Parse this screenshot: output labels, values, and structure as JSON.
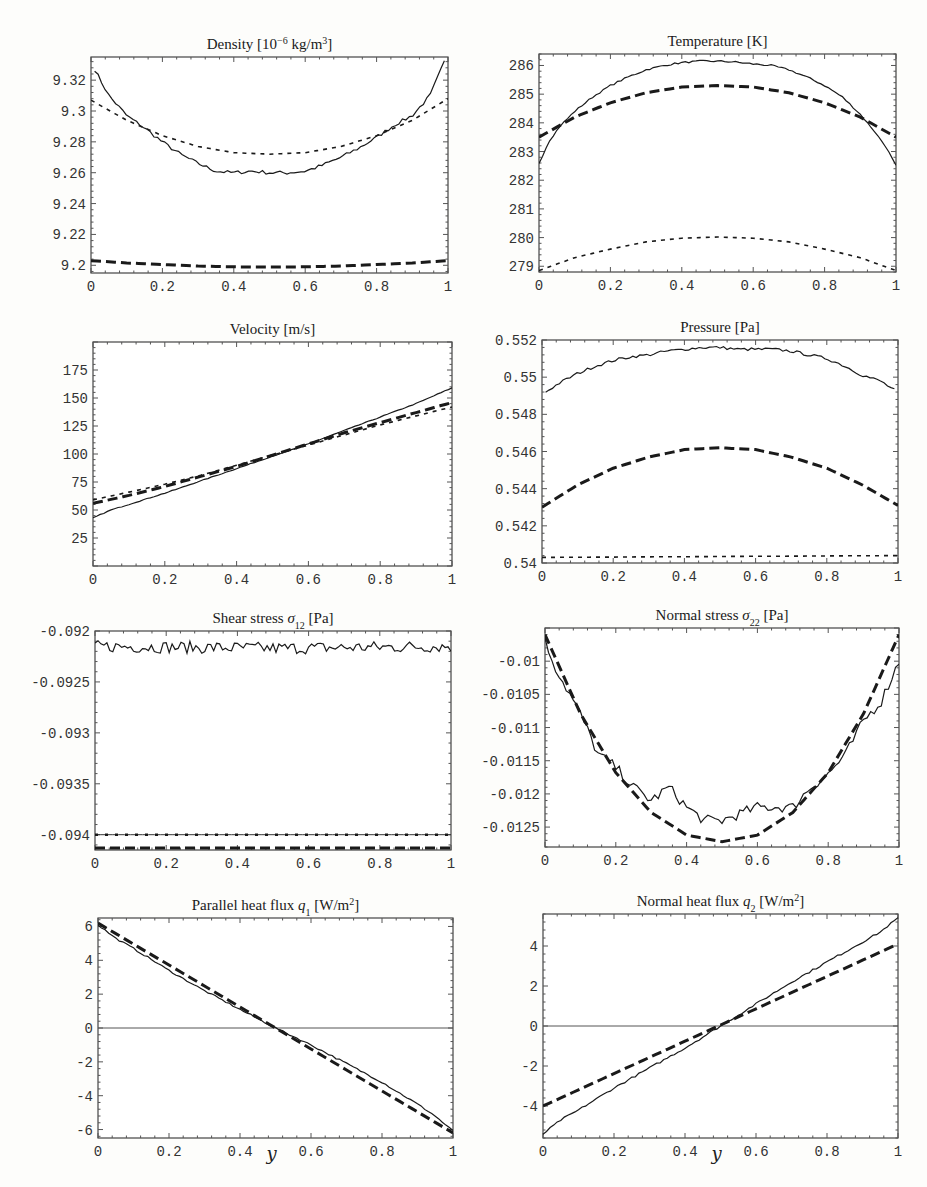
{
  "page": {
    "header_fragment": "",
    "x_axis_label": "y"
  },
  "chart_data": [
    {
      "id": "density",
      "type": "line",
      "title": "Density [10⁻⁶ kg/m³]",
      "title_parts": {
        "main": "Density [10",
        "sup1": "−6",
        "mid": " kg/m",
        "sup2": "3",
        "end": "]"
      },
      "xlabel": "",
      "ylabel": "",
      "xlim": [
        0,
        1
      ],
      "ylim": [
        9.195,
        9.335
      ],
      "xticks": [
        0,
        0.2,
        0.4,
        0.6,
        0.8,
        1
      ],
      "xtick_labels": [
        "0",
        "0.2",
        "0.4",
        "0.6",
        "0.8",
        "1"
      ],
      "yticks": [
        9.2,
        9.22,
        9.24,
        9.26,
        9.28,
        9.3,
        9.32
      ],
      "ytick_labels": [
        "9.2",
        "9.22",
        "9.24",
        "9.26",
        "9.28",
        "9.3",
        "9.32"
      ],
      "frame": {
        "x": 91,
        "y": 57,
        "w": 357,
        "h": 216
      },
      "series": [
        {
          "name": "simulation",
          "style": "solid",
          "x": [
            0.01,
            0.05,
            0.1,
            0.15,
            0.2,
            0.25,
            0.3,
            0.35,
            0.4,
            0.45,
            0.5,
            0.55,
            0.6,
            0.65,
            0.7,
            0.75,
            0.8,
            0.85,
            0.9,
            0.95,
            0.99
          ],
          "y": [
            9.327,
            9.31,
            9.297,
            9.289,
            9.28,
            9.272,
            9.266,
            9.261,
            9.26,
            9.261,
            9.26,
            9.26,
            9.261,
            9.265,
            9.27,
            9.276,
            9.283,
            9.291,
            9.297,
            9.31,
            9.332
          ],
          "noise": 0.0012
        },
        {
          "name": "model-short-dash",
          "style": "short-dash",
          "x": [
            0,
            0.1,
            0.2,
            0.3,
            0.4,
            0.5,
            0.6,
            0.7,
            0.8,
            0.9,
            1
          ],
          "y": [
            9.307,
            9.294,
            9.284,
            9.277,
            9.273,
            9.272,
            9.273,
            9.277,
            9.284,
            9.294,
            9.308
          ]
        },
        {
          "name": "model-long-dash",
          "style": "long-dash",
          "x": [
            0,
            0.1,
            0.2,
            0.3,
            0.4,
            0.5,
            0.6,
            0.7,
            0.8,
            0.9,
            1
          ],
          "y": [
            9.203,
            9.2015,
            9.2005,
            9.1995,
            9.199,
            9.1988,
            9.199,
            9.1995,
            9.2005,
            9.2015,
            9.203
          ]
        }
      ]
    },
    {
      "id": "temperature",
      "type": "line",
      "title": "Temperature [K]",
      "title_parts": {
        "main": "Temperature [K]",
        "sup1": "",
        "mid": "",
        "sup2": "",
        "end": ""
      },
      "xlabel": "",
      "ylabel": "",
      "xlim": [
        0,
        1
      ],
      "ylim": [
        278.8,
        286.4
      ],
      "xticks": [
        0,
        0.2,
        0.4,
        0.6,
        0.8,
        1
      ],
      "xtick_labels": [
        "0",
        "0.2",
        "0.4",
        "0.6",
        "0.8",
        "1"
      ],
      "yticks": [
        279,
        280,
        281,
        282,
        283,
        284,
        285,
        286
      ],
      "ytick_labels": [
        "279",
        "280",
        "281",
        "282",
        "283",
        "284",
        "285",
        "286"
      ],
      "frame": {
        "x": 539,
        "y": 54,
        "w": 357,
        "h": 218
      },
      "series": [
        {
          "name": "simulation",
          "style": "solid",
          "x": [
            0,
            0.03,
            0.06,
            0.1,
            0.15,
            0.2,
            0.25,
            0.3,
            0.35,
            0.4,
            0.45,
            0.5,
            0.55,
            0.6,
            0.65,
            0.7,
            0.75,
            0.8,
            0.85,
            0.9,
            0.94,
            0.97,
            1
          ],
          "y": [
            282.6,
            283.4,
            283.9,
            284.4,
            284.9,
            285.3,
            285.6,
            285.85,
            286.0,
            286.1,
            286.15,
            286.15,
            286.12,
            286.05,
            286.0,
            285.85,
            285.6,
            285.3,
            284.9,
            284.3,
            283.7,
            283.2,
            282.5
          ],
          "noise": 0.03
        },
        {
          "name": "model-long-dash",
          "style": "long-dash",
          "x": [
            0,
            0.1,
            0.2,
            0.3,
            0.4,
            0.5,
            0.6,
            0.7,
            0.8,
            0.9,
            1
          ],
          "y": [
            283.5,
            284.2,
            284.7,
            285.05,
            285.25,
            285.3,
            285.25,
            285.05,
            284.7,
            284.2,
            283.5
          ]
        },
        {
          "name": "model-short-dash",
          "style": "short-dash",
          "x": [
            0,
            0.1,
            0.2,
            0.3,
            0.4,
            0.5,
            0.6,
            0.7,
            0.8,
            0.9,
            1
          ],
          "y": [
            278.85,
            279.3,
            279.6,
            279.85,
            279.98,
            280.02,
            279.98,
            279.85,
            279.6,
            279.3,
            278.85
          ]
        }
      ]
    },
    {
      "id": "velocity",
      "type": "line",
      "title": "Velocity [m/s]",
      "title_parts": {
        "main": "Velocity [m/s]",
        "sup1": "",
        "mid": "",
        "sup2": "",
        "end": ""
      },
      "xlabel": "",
      "ylabel": "",
      "xlim": [
        0,
        1
      ],
      "ylim": [
        0,
        200
      ],
      "xticks": [
        0,
        0.2,
        0.4,
        0.6,
        0.8,
        1
      ],
      "xtick_labels": [
        "0",
        "0.2",
        "0.4",
        "0.6",
        "0.8",
        "1"
      ],
      "yticks": [
        25,
        50,
        75,
        100,
        125,
        150,
        175
      ],
      "ytick_labels": [
        "25",
        "50",
        "75",
        "100",
        "125",
        "150",
        "175"
      ],
      "frame": {
        "x": 93,
        "y": 342,
        "w": 359,
        "h": 224
      },
      "series": [
        {
          "name": "simulation",
          "style": "solid",
          "x": [
            0,
            0.05,
            0.1,
            0.2,
            0.3,
            0.4,
            0.5,
            0.6,
            0.7,
            0.8,
            0.9,
            1
          ],
          "y": [
            43,
            50,
            55,
            65,
            76,
            87,
            98,
            109,
            121,
            133,
            145,
            159
          ],
          "noise": 0.3
        },
        {
          "name": "model-long-dash",
          "style": "long-dash",
          "x": [
            0,
            0.1,
            0.2,
            0.3,
            0.4,
            0.5,
            0.6,
            0.7,
            0.8,
            0.9,
            1
          ],
          "y": [
            56,
            63,
            71,
            80,
            89,
            99,
            109,
            119,
            128,
            137,
            146
          ]
        },
        {
          "name": "model-short-dash",
          "style": "short-dash",
          "x": [
            0,
            0.1,
            0.2,
            0.3,
            0.4,
            0.5,
            0.6,
            0.7,
            0.8,
            0.9,
            1
          ],
          "y": [
            59,
            66,
            73,
            81,
            90,
            99,
            108,
            117,
            126,
            134,
            142
          ]
        }
      ]
    },
    {
      "id": "pressure",
      "type": "line",
      "title": "Pressure [Pa]",
      "title_parts": {
        "main": "Pressure [Pa]",
        "sup1": "",
        "mid": "",
        "sup2": "",
        "end": ""
      },
      "xlabel": "",
      "ylabel": "",
      "xlim": [
        0,
        1
      ],
      "ylim": [
        0.54,
        0.552
      ],
      "xticks": [
        0,
        0.2,
        0.4,
        0.6,
        0.8,
        1
      ],
      "xtick_labels": [
        "0",
        "0.2",
        "0.4",
        "0.6",
        "0.8",
        "1"
      ],
      "yticks": [
        0.54,
        0.542,
        0.544,
        0.546,
        0.548,
        0.55,
        0.552
      ],
      "ytick_labels": [
        "0.54",
        "0.542",
        "0.544",
        "0.546",
        "0.548",
        "0.55",
        "0.552"
      ],
      "frame": {
        "x": 542,
        "y": 340,
        "w": 356,
        "h": 223
      },
      "series": [
        {
          "name": "simulation",
          "style": "solid",
          "x": [
            0.01,
            0.05,
            0.1,
            0.15,
            0.2,
            0.25,
            0.3,
            0.35,
            0.4,
            0.45,
            0.5,
            0.55,
            0.6,
            0.65,
            0.7,
            0.75,
            0.8,
            0.85,
            0.9,
            0.95,
            0.99
          ],
          "y": [
            0.5492,
            0.5497,
            0.5502,
            0.5506,
            0.5509,
            0.5511,
            0.5512,
            0.5514,
            0.5515,
            0.5516,
            0.5516,
            0.5515,
            0.5515,
            0.5515,
            0.5514,
            0.5512,
            0.551,
            0.5506,
            0.5501,
            0.5498,
            0.5493
          ],
          "noise": 8e-05
        },
        {
          "name": "model-long-dash",
          "style": "long-dash",
          "x": [
            0,
            0.1,
            0.2,
            0.3,
            0.4,
            0.5,
            0.6,
            0.7,
            0.8,
            0.9,
            1
          ],
          "y": [
            0.543,
            0.5442,
            0.5451,
            0.5457,
            0.5461,
            0.5462,
            0.5461,
            0.5457,
            0.5451,
            0.5442,
            0.5431
          ]
        },
        {
          "name": "model-short-dash",
          "style": "short-dash",
          "x": [
            0,
            1
          ],
          "y": [
            0.5403,
            0.5404
          ]
        }
      ]
    },
    {
      "id": "shear-stress",
      "type": "line",
      "title": "Shear stress σ12 [Pa]",
      "title_parts": {
        "main": "Shear stress ",
        "sym": "σ",
        "sub": "12",
        "end": " [Pa]"
      },
      "xlabel": "",
      "ylabel": "",
      "xlim": [
        0,
        1
      ],
      "ylim": [
        -0.09415,
        -0.092
      ],
      "xticks": [
        0,
        0.2,
        0.4,
        0.6,
        0.8,
        1
      ],
      "xtick_labels": [
        "0",
        "0.2",
        "0.4",
        "0.6",
        "0.8",
        "1"
      ],
      "yticks": [
        -0.094,
        -0.0935,
        -0.093,
        -0.0925,
        -0.092
      ],
      "ytick_labels": [
        "-0.094",
        "-0.0935",
        "-0.093",
        "-0.0925",
        "-0.092"
      ],
      "frame": {
        "x": 95,
        "y": 631,
        "w": 356,
        "h": 219
      },
      "series": [
        {
          "name": "simulation",
          "style": "solid",
          "x": [
            0,
            0.5,
            1
          ],
          "y": [
            -0.09215,
            -0.09217,
            -0.09215
          ],
          "noise": 4e-05,
          "jagged": true
        },
        {
          "name": "model-short-dash",
          "style": "dotted-on-line",
          "x": [
            0,
            1
          ],
          "y": [
            -0.094,
            -0.094
          ]
        },
        {
          "name": "model-long-dash",
          "style": "long-dash",
          "x": [
            0,
            1
          ],
          "y": [
            -0.09413,
            -0.09413
          ]
        }
      ]
    },
    {
      "id": "normal-stress",
      "type": "line",
      "title": "Normal stress σ22 [Pa]",
      "title_parts": {
        "main": "Normal stress ",
        "sym": "σ",
        "sub": "22",
        "end": " [Pa]"
      },
      "xlabel": "",
      "ylabel": "",
      "xlim": [
        0,
        1
      ],
      "ylim": [
        -0.0128,
        -0.0095
      ],
      "xticks": [
        0,
        0.2,
        0.4,
        0.6,
        0.8,
        1
      ],
      "xtick_labels": [
        "0",
        "0.2",
        "0.4",
        "0.6",
        "0.8",
        "1"
      ],
      "yticks": [
        -0.0125,
        -0.012,
        -0.0115,
        -0.011,
        -0.0105,
        -0.01
      ],
      "ytick_labels": [
        "-0.0125",
        "-0.012",
        "-0.0115",
        "-0.011",
        "-0.0105",
        "-0.01"
      ],
      "frame": {
        "x": 545,
        "y": 628,
        "w": 354,
        "h": 219
      },
      "series": [
        {
          "name": "simulation",
          "style": "solid",
          "x": [
            0,
            0.03,
            0.06,
            0.1,
            0.15,
            0.2,
            0.25,
            0.3,
            0.35,
            0.4,
            0.45,
            0.5,
            0.55,
            0.6,
            0.65,
            0.7,
            0.75,
            0.8,
            0.85,
            0.9,
            0.95,
            1
          ],
          "y": [
            -0.0097,
            -0.0101,
            -0.0104,
            -0.0108,
            -0.0114,
            -0.0116,
            -0.0119,
            -0.0121,
            -0.0119,
            -0.0122,
            -0.0124,
            -0.0124,
            -0.0123,
            -0.0122,
            -0.0122,
            -0.0122,
            -0.0119,
            -0.0117,
            -0.0114,
            -0.0109,
            -0.0106,
            -0.01
          ],
          "noise": 8e-05
        },
        {
          "name": "model-long-dash",
          "style": "long-dash",
          "x": [
            0,
            0.1,
            0.2,
            0.3,
            0.4,
            0.5,
            0.6,
            0.7,
            0.8,
            0.9,
            1
          ],
          "y": [
            -0.0096,
            -0.01079,
            -0.01168,
            -0.01228,
            -0.01262,
            -0.01272,
            -0.01262,
            -0.01228,
            -0.01168,
            -0.01079,
            -0.0096
          ]
        }
      ]
    },
    {
      "id": "parallel-heat-flux",
      "type": "line",
      "title": "Parallel heat flux q1 [W/m²]",
      "title_parts": {
        "main": "Parallel heat flux ",
        "sym": "q",
        "sub": "1",
        "end": " [W/m",
        "sup": "2",
        "end2": "]"
      },
      "xlabel": "y",
      "ylabel": "",
      "xlim": [
        0,
        1
      ],
      "ylim": [
        -6.5,
        6.5
      ],
      "xticks": [
        0,
        0.2,
        0.4,
        0.6,
        0.8,
        1
      ],
      "xtick_labels": [
        "0",
        "0.2",
        "0.4",
        "0.6",
        "0.8",
        "1"
      ],
      "yticks": [
        -6,
        -4,
        -2,
        0,
        2,
        4,
        6
      ],
      "ytick_labels": [
        "-6",
        "-4",
        "-2",
        "0",
        "2",
        "4",
        "6"
      ],
      "zero_line": true,
      "frame": {
        "x": 98,
        "y": 918,
        "w": 355,
        "h": 220
      },
      "series": [
        {
          "name": "simulation",
          "style": "solid",
          "x": [
            0,
            0.05,
            0.1,
            0.2,
            0.3,
            0.4,
            0.5,
            0.6,
            0.7,
            0.8,
            0.9,
            0.95,
            1
          ],
          "y": [
            6.1,
            5.3,
            4.7,
            3.4,
            2.2,
            1.1,
            0,
            -1.0,
            -2.1,
            -3.2,
            -4.5,
            -5.2,
            -6.1
          ],
          "noise": 0.05
        },
        {
          "name": "model-long-dash",
          "style": "long-dash",
          "x": [
            0,
            1
          ],
          "y": [
            6.2,
            -6.2
          ]
        }
      ]
    },
    {
      "id": "normal-heat-flux",
      "type": "line",
      "title": "Normal heat flux q2 [W/m²]",
      "title_parts": {
        "main": "Normal heat flux ",
        "sym": "q",
        "sub": "2",
        "end": " [W/m",
        "sup": "2",
        "end2": "]"
      },
      "xlabel": "y",
      "ylabel": "",
      "xlim": [
        0,
        1
      ],
      "ylim": [
        -5.6,
        5.6
      ],
      "xticks": [
        0,
        0.2,
        0.4,
        0.6,
        0.8,
        1
      ],
      "xtick_labels": [
        "0",
        "0.2",
        "0.4",
        "0.6",
        "0.8",
        "1"
      ],
      "yticks": [
        -4,
        -2,
        0,
        2,
        4
      ],
      "ytick_labels": [
        "-4",
        "-2",
        "0",
        "2",
        "4"
      ],
      "zero_line": true,
      "frame": {
        "x": 543,
        "y": 914,
        "w": 355,
        "h": 224
      },
      "series": [
        {
          "name": "simulation",
          "style": "solid",
          "x": [
            0,
            0.05,
            0.1,
            0.2,
            0.3,
            0.4,
            0.5,
            0.6,
            0.7,
            0.8,
            0.9,
            0.95,
            1
          ],
          "y": [
            -5.4,
            -4.7,
            -4.2,
            -3.1,
            -2.1,
            -1.1,
            0,
            1.1,
            2.2,
            3.2,
            4.2,
            4.7,
            5.4
          ],
          "noise": 0.05
        },
        {
          "name": "model-long-dash",
          "style": "long-dash",
          "x": [
            0,
            1
          ],
          "y": [
            -4.0,
            4.1
          ]
        }
      ]
    }
  ]
}
